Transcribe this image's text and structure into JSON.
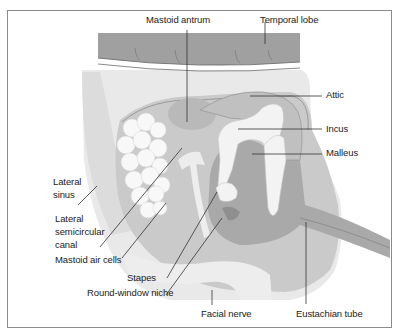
{
  "diagram": {
    "colors": {
      "temporal_lobe": "#9c9c9c",
      "bone_light": "#e8e8e8",
      "tissue_mid": "#c8c8c8",
      "cavity_dark": "#a8a8a8",
      "ossicles": "#f2f2f2",
      "frame": "#8a8a8a",
      "text": "#222222"
    },
    "labels": {
      "mastoid_antrum": "Mastoid antrum",
      "temporal_lobe": "Temporal lobe",
      "attic": "Attic",
      "incus": "Incus",
      "malleus": "Malleus",
      "lateral_sinus_1": "Lateral",
      "lateral_sinus_2": "sinus",
      "lateral_canal_1": "Lateral",
      "lateral_canal_2": "semicircular",
      "lateral_canal_3": "canal",
      "mastoid_air_cells": "Mastoid air cells",
      "stapes": "Stapes",
      "round_window_niche": "Round-window niche",
      "facial_nerve": "Facial nerve",
      "eustachian_tube": "Eustachian tube"
    }
  }
}
